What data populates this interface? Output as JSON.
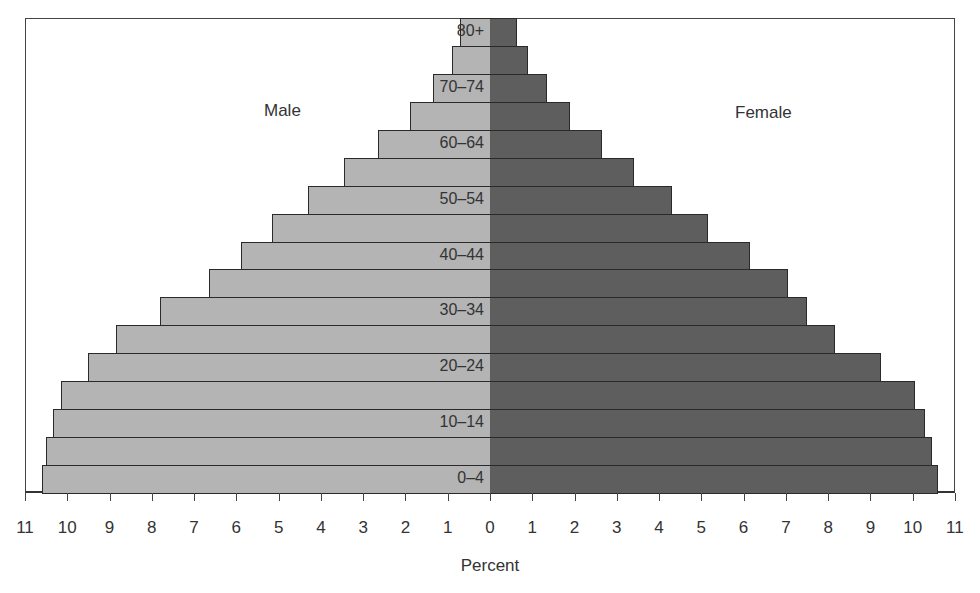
{
  "chart_data": {
    "type": "bar",
    "subtype": "population-pyramid",
    "title": "",
    "xlabel": "Percent",
    "ylabel": "",
    "xlim": [
      -11,
      11
    ],
    "x_ticks": [
      11,
      10,
      9,
      8,
      7,
      6,
      5,
      4,
      3,
      2,
      1,
      0,
      1,
      2,
      3,
      4,
      5,
      6,
      7,
      8,
      9,
      10,
      11
    ],
    "categories": [
      "0–4",
      "5–9",
      "10–14",
      "15–19",
      "20–24",
      "25–29",
      "30–34",
      "35–39",
      "40–44",
      "45–49",
      "50–54",
      "55–59",
      "60–64",
      "65–69",
      "70–74",
      "75–79",
      "80+"
    ],
    "labeled_categories": [
      "0–4",
      "10–14",
      "20–24",
      "30–34",
      "40–44",
      "50–54",
      "60–64",
      "70–74",
      "80+"
    ],
    "series": [
      {
        "name": "Male",
        "side": "left",
        "color": "#b4b4b4",
        "values": [
          10.6,
          10.5,
          10.35,
          10.15,
          9.5,
          8.85,
          7.8,
          6.65,
          5.9,
          5.15,
          4.3,
          3.45,
          2.65,
          1.9,
          1.35,
          0.9,
          0.7
        ]
      },
      {
        "name": "Female",
        "side": "right",
        "color": "#5e5e5e",
        "values": [
          10.6,
          10.45,
          10.3,
          10.05,
          9.25,
          8.15,
          7.5,
          7.05,
          6.15,
          5.15,
          4.3,
          3.4,
          2.65,
          1.9,
          1.35,
          0.9,
          0.65
        ]
      }
    ],
    "annotations": {
      "male_label": "Male",
      "female_label": "Female"
    },
    "grid": false,
    "legend": "none (inline labels)"
  }
}
